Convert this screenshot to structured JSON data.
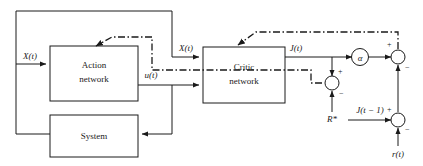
{
  "diagram": {
    "colors": {
      "line": "#1a1a1a",
      "background": "#ffffff",
      "text": "#1a1a1a"
    },
    "blocks": [
      {
        "id": "action",
        "label_line1": "Action",
        "label_line2": "network"
      },
      {
        "id": "system",
        "label_line1": "System",
        "label_line2": ""
      },
      {
        "id": "critic",
        "label_line1": "Critic",
        "label_line2": "network"
      }
    ],
    "nodes": [
      {
        "id": "alpha",
        "label": "α"
      },
      {
        "id": "sum-reward",
        "label": ""
      },
      {
        "id": "sum-top",
        "label": ""
      },
      {
        "id": "sum-bottom",
        "label": ""
      }
    ],
    "signals": [
      {
        "id": "x-in",
        "label": "X(t)"
      },
      {
        "id": "x-critic",
        "label": "X(t)"
      },
      {
        "id": "u-out",
        "label": "u(t)"
      },
      {
        "id": "j-out",
        "label": "J(t)"
      },
      {
        "id": "r-star",
        "label": "R*"
      },
      {
        "id": "j-prev",
        "label": "J(t − 1)"
      },
      {
        "id": "r-t",
        "label": "r(t)"
      }
    ],
    "signs": [
      {
        "id": "sum-reward-plus",
        "label": "+"
      },
      {
        "id": "sum-reward-minus",
        "label": "−"
      },
      {
        "id": "sum-top-plus",
        "label": "+"
      },
      {
        "id": "sum-top-minus",
        "label": "−"
      },
      {
        "id": "sum-bottom-plus",
        "label": "+"
      },
      {
        "id": "sum-bottom-minus",
        "label": "−"
      }
    ]
  }
}
